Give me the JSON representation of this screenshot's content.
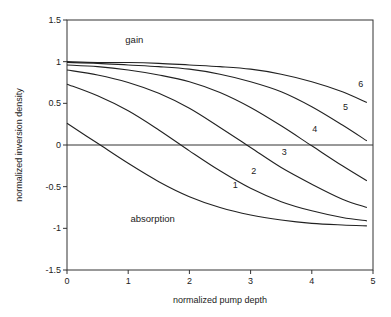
{
  "chart_data": {
    "type": "line",
    "title": "",
    "xlabel": "normalized  pump depth",
    "ylabel": "normalized inversion density",
    "xlim": [
      0,
      5
    ],
    "ylim": [
      -1.5,
      1.5
    ],
    "xticks": [
      "0",
      "1",
      "2",
      "3",
      "4",
      "5"
    ],
    "yticks": [
      "1.5",
      "1",
      "0.5",
      "0",
      "-0.5",
      "-1",
      "-1.5"
    ],
    "grid": false,
    "annotations": [
      {
        "text": "gain",
        "x": 1.1,
        "y": 1.22
      },
      {
        "text": "absorption",
        "x": 1.4,
        "y": -0.92
      }
    ],
    "x": [
      0,
      0.5,
      1,
      1.5,
      2,
      2.5,
      3,
      3.5,
      4,
      4.5,
      4.9
    ],
    "series": [
      {
        "name": "1",
        "label_pos": [
          2.75,
          -0.52
        ],
        "values": [
          0.26,
          0.02,
          -0.22,
          -0.44,
          -0.62,
          -0.75,
          -0.84,
          -0.9,
          -0.94,
          -0.96,
          -0.97
        ]
      },
      {
        "name": "2",
        "label_pos": [
          3.05,
          -0.35
        ],
        "values": [
          0.73,
          0.59,
          0.41,
          0.18,
          -0.07,
          -0.31,
          -0.52,
          -0.68,
          -0.79,
          -0.87,
          -0.91
        ]
      },
      {
        "name": "3",
        "label_pos": [
          3.55,
          -0.12
        ],
        "values": [
          0.9,
          0.84,
          0.75,
          0.62,
          0.44,
          0.21,
          -0.03,
          -0.27,
          -0.47,
          -0.65,
          -0.75
        ]
      },
      {
        "name": "4",
        "label_pos": [
          4.05,
          0.16
        ],
        "values": [
          0.96,
          0.94,
          0.9,
          0.84,
          0.76,
          0.63,
          0.45,
          0.23,
          -0.01,
          -0.25,
          -0.43
        ]
      },
      {
        "name": "5",
        "label_pos": [
          4.55,
          0.42
        ],
        "values": [
          0.99,
          0.98,
          0.96,
          0.94,
          0.91,
          0.85,
          0.76,
          0.64,
          0.46,
          0.24,
          0.05
        ]
      },
      {
        "name": "6",
        "label_pos": [
          4.8,
          0.7
        ],
        "values": [
          1.0,
          0.99,
          0.99,
          0.98,
          0.96,
          0.94,
          0.91,
          0.85,
          0.76,
          0.64,
          0.51
        ]
      }
    ]
  }
}
